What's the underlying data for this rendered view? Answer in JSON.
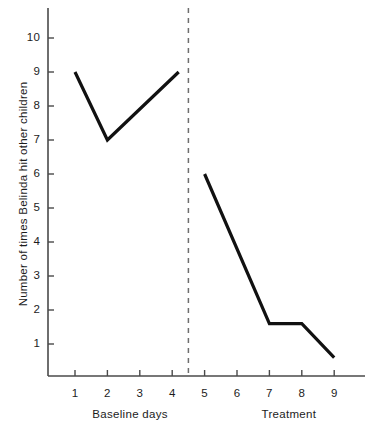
{
  "chart_data": {
    "type": "line",
    "title": "",
    "xlabel": "",
    "ylabel": "Number of times Belinda hit other children",
    "xlim": [
      0,
      10
    ],
    "ylim": [
      0,
      10.8
    ],
    "grid": false,
    "legend": null,
    "y_ticks": [
      1,
      2,
      3,
      4,
      5,
      6,
      7,
      8,
      9,
      10
    ],
    "y_tick_labels": [
      "1",
      "2",
      "3",
      "4",
      "5",
      "6",
      "7",
      "8",
      "9",
      "10"
    ],
    "x_ticks": [
      1,
      2,
      3,
      4,
      5,
      6,
      7,
      8,
      9
    ],
    "x_tick_labels": [
      "1",
      "2",
      "3",
      "4",
      "5",
      "6",
      "7",
      "8",
      "9"
    ],
    "phase_divider_x": 4.5,
    "phase_divider_style": "dashed",
    "series": [
      {
        "name": "Baseline days",
        "x": [
          1,
          2,
          4.2
        ],
        "values": [
          9,
          7,
          9
        ]
      },
      {
        "name": "Treatment",
        "x": [
          5,
          7,
          8,
          9
        ],
        "values": [
          6,
          1.6,
          1.6,
          0.6
        ]
      }
    ],
    "phase_labels": [
      {
        "text": "Baseline days",
        "center_x": 2.7
      },
      {
        "text": "Treatment",
        "center_x": 7.6
      }
    ],
    "line_color": "#111111",
    "axis_color": "#4a4a4a",
    "divider_color": "#6e6e6e",
    "background_color": "#ffffff"
  }
}
